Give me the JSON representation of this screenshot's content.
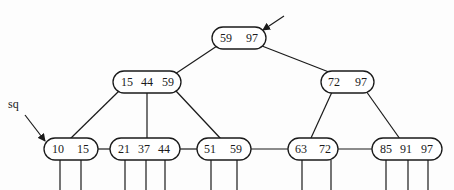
{
  "diagram": {
    "root_pointer_arrow": {
      "from": [
        284,
        16
      ],
      "to": [
        263,
        30
      ]
    },
    "sq_label": {
      "text": "sq",
      "x": 8,
      "y": 108
    },
    "sq_arrow": {
      "from": [
        25,
        115
      ],
      "to": [
        45,
        141
      ]
    },
    "nodes": [
      {
        "id": "root",
        "keys": [
          "59",
          "97"
        ],
        "x": 212,
        "y": 27,
        "w": 54,
        "h": 22,
        "key_x": [
          226,
          252
        ]
      },
      {
        "id": "internal-left",
        "keys": [
          "15",
          "44",
          "59"
        ],
        "x": 113,
        "y": 71,
        "w": 68,
        "h": 22,
        "key_x": [
          127,
          147,
          168
        ]
      },
      {
        "id": "internal-right",
        "keys": [
          "72",
          "97"
        ],
        "x": 321,
        "y": 71,
        "w": 53,
        "h": 22,
        "key_x": [
          334,
          361
        ]
      },
      {
        "id": "leaf-1",
        "keys": [
          "10",
          "15"
        ],
        "x": 44,
        "y": 138,
        "w": 54,
        "h": 22,
        "key_x": [
          58,
          83
        ]
      },
      {
        "id": "leaf-2",
        "keys": [
          "21",
          "37",
          "44"
        ],
        "x": 110,
        "y": 138,
        "w": 70,
        "h": 22,
        "key_x": [
          124,
          144,
          164
        ]
      },
      {
        "id": "leaf-3",
        "keys": [
          "51",
          "59"
        ],
        "x": 197,
        "y": 138,
        "w": 54,
        "h": 22,
        "key_x": [
          210,
          236
        ]
      },
      {
        "id": "leaf-4",
        "keys": [
          "63",
          "72"
        ],
        "x": 288,
        "y": 138,
        "w": 50,
        "h": 22,
        "key_x": [
          301,
          325
        ]
      },
      {
        "id": "leaf-5",
        "keys": [
          "85",
          "91",
          "97"
        ],
        "x": 372,
        "y": 138,
        "w": 70,
        "h": 22,
        "key_x": [
          386,
          406,
          427
        ]
      }
    ],
    "edges": [
      {
        "from": [
          217,
          46
        ],
        "to": [
          175,
          74
        ]
      },
      {
        "from": [
          262,
          46
        ],
        "to": [
          334,
          74
        ]
      },
      {
        "from": [
          119,
          91
        ],
        "to": [
          70,
          139
        ]
      },
      {
        "from": [
          147,
          93
        ],
        "to": [
          147,
          138
        ]
      },
      {
        "from": [
          176,
          91
        ],
        "to": [
          221,
          139
        ]
      },
      {
        "from": [
          332,
          92
        ],
        "to": [
          311,
          138
        ]
      },
      {
        "from": [
          366,
          91
        ],
        "to": [
          400,
          139
        ]
      }
    ],
    "leaf_links": [
      {
        "from": [
          98,
          149
        ],
        "to": [
          110,
          149
        ]
      },
      {
        "from": [
          180,
          149
        ],
        "to": [
          197,
          149
        ]
      },
      {
        "from": [
          251,
          149
        ],
        "to": [
          288,
          149
        ]
      },
      {
        "from": [
          338,
          149
        ],
        "to": [
          372,
          149
        ]
      }
    ],
    "record_pointers": [
      {
        "x": 60,
        "y1": 160,
        "y2": 190
      },
      {
        "x": 81,
        "y1": 160,
        "y2": 190
      },
      {
        "x": 125,
        "y1": 160,
        "y2": 190
      },
      {
        "x": 146,
        "y1": 160,
        "y2": 190
      },
      {
        "x": 165,
        "y1": 160,
        "y2": 190
      },
      {
        "x": 211,
        "y1": 160,
        "y2": 190
      },
      {
        "x": 237,
        "y1": 160,
        "y2": 190
      },
      {
        "x": 302,
        "y1": 160,
        "y2": 190
      },
      {
        "x": 331,
        "y1": 160,
        "y2": 190
      },
      {
        "x": 386,
        "y1": 160,
        "y2": 190
      },
      {
        "x": 408,
        "y1": 160,
        "y2": 190
      },
      {
        "x": 428,
        "y1": 160,
        "y2": 190
      }
    ],
    "colors": {
      "stroke": "#1a1a1a",
      "background": "#fdfdfd"
    }
  }
}
